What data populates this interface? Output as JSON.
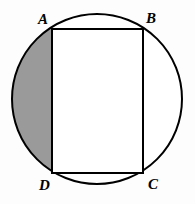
{
  "figure": {
    "name": "circle-with-inscribed-rectangle",
    "canvas": {
      "width": 195,
      "height": 204,
      "background": "#fdfdfd"
    },
    "colors": {
      "stroke": "#000000",
      "shaded_segment_fill": "#9a9a9a",
      "rectangle_fill": "#ffffff",
      "circle_fill": "#ffffff"
    },
    "circle": {
      "name": "outer-circle",
      "center_x": 97,
      "center_y": 99,
      "radius": 86,
      "stroke_width": 2,
      "fill": "#ffffff"
    },
    "rectangle": {
      "name": "inscribed-rectangle-ABCD",
      "left": 52,
      "top": 29,
      "right": 143,
      "bottom": 173,
      "width": 91,
      "height": 144,
      "stroke_width": 2,
      "fill": "#ffffff"
    },
    "shaded_region": {
      "name": "shaded-circular-segment",
      "description": "circular segment left of chord AD",
      "chord_x": 52,
      "fill": "#9a9a9a",
      "shaded": true
    },
    "unshaded_region": {
      "name": "right-circular-segment",
      "description": "circular segment right of chord BC",
      "chord_x": 143,
      "fill": "#ffffff",
      "shaded": false
    },
    "vertices": [
      {
        "id": "A",
        "label": "A",
        "corner": "top-left",
        "x": 52,
        "y": 29
      },
      {
        "id": "B",
        "label": "B",
        "corner": "top-right",
        "x": 143,
        "y": 29
      },
      {
        "id": "C",
        "label": "C",
        "corner": "bottom-right",
        "x": 143,
        "y": 173
      },
      {
        "id": "D",
        "label": "D",
        "corner": "bottom-left",
        "x": 52,
        "y": 173
      }
    ]
  }
}
